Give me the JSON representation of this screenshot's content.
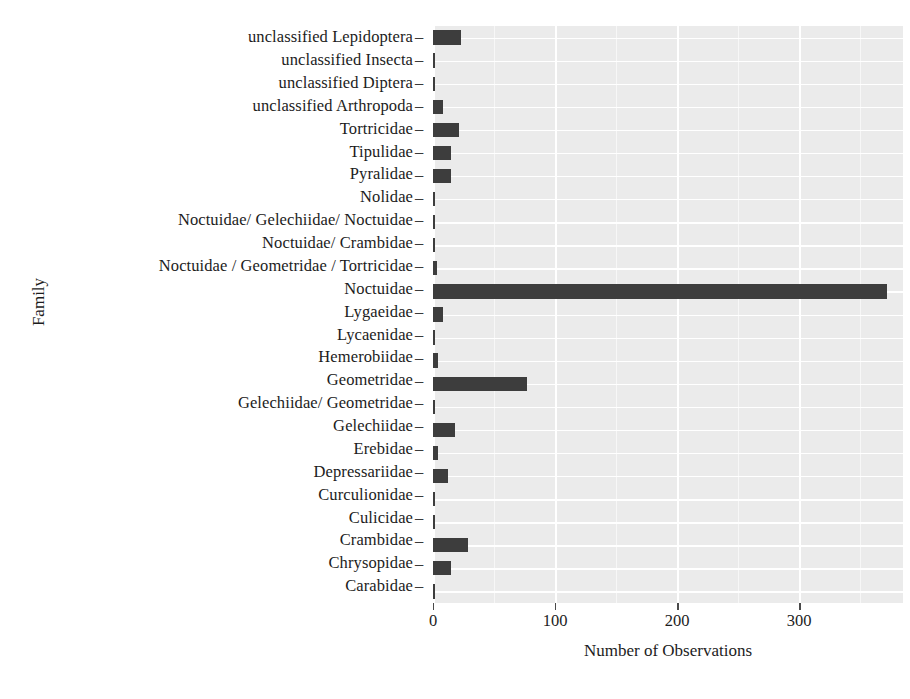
{
  "chart_data": {
    "type": "bar",
    "orientation": "horizontal",
    "title": "",
    "xlabel": "Number of Observations",
    "ylabel": "Family",
    "xlim": [
      0,
      385
    ],
    "xticks": [
      0,
      100,
      200,
      300
    ],
    "xtick_labels": [
      "0",
      "100",
      "200",
      "300"
    ],
    "grid": true,
    "legend": "none",
    "bar_color": "#3d3d3d",
    "panel_color": "#ebebeb",
    "gridline_color": "#ffffff",
    "categories": [
      "unclassified Lepidoptera",
      "unclassified Insecta",
      "unclassified Diptera",
      "unclassified Arthropoda",
      "Tortricidae",
      "Tipulidae",
      "Pyralidae",
      "Nolidae",
      "Noctuidae/ Gelechiidae/ Noctuidae",
      "Noctuidae/ Crambidae",
      "Noctuidae / Geometridae / Tortricidae",
      "Noctuidae",
      "Lygaeidae",
      "Lycaenidae",
      "Hemerobiidae",
      "Geometridae",
      "Gelechiidae/ Geometridae",
      "Gelechiidae",
      "Erebidae",
      "Depressariidae",
      "Curculionidae",
      "Culicidae",
      "Crambidae",
      "Chrysopidae",
      "Carabidae"
    ],
    "values": [
      23,
      2,
      2,
      8,
      21,
      15,
      15,
      2,
      2,
      2,
      3,
      372,
      8,
      2,
      4,
      77,
      2,
      18,
      4,
      12,
      2,
      2,
      29,
      15,
      1
    ]
  },
  "axis": {
    "y_title": "Family",
    "x_title": "Number of Observations",
    "tick_dash": "–"
  }
}
